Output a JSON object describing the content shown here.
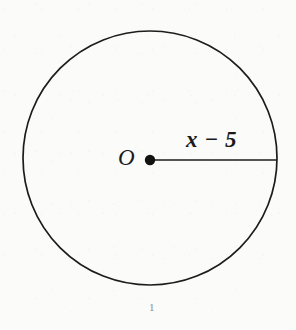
{
  "figure": {
    "type": "circle-with-labeled-radius",
    "circle": {
      "name": "circle-outline",
      "center_x": 150,
      "center_y": 158,
      "radius": 127,
      "stroke_color": "#1c1c1c",
      "stroke_width": 1.7,
      "fill": "none"
    },
    "center_point": {
      "name": "center-dot",
      "x": 150,
      "y": 160,
      "radius": 5.2,
      "color": "#121212"
    },
    "radius_segment": {
      "name": "radius-line",
      "x1": 150,
      "y1": 160,
      "x2": 277,
      "y2": 160,
      "stroke_color": "#1c1c1c",
      "stroke_width": 1.7
    },
    "labels": {
      "center_label": "O",
      "radius_label": "x − 5",
      "page_mark": "1"
    },
    "colors": {
      "ink": "#1c1c1c",
      "paper": "#fbfbfa",
      "faint_mark": "#8d8d8a"
    }
  }
}
